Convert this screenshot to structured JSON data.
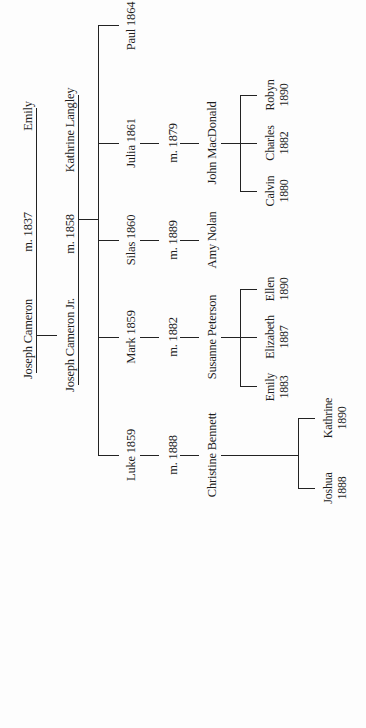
{
  "generation1": {
    "husband": "Joseph Cameron",
    "marriage": "m. 1837",
    "wife": "Emily"
  },
  "generation2": {
    "husband": "Joseph Cameron Jr.",
    "marriage": "m. 1858",
    "wife": "Kathrine Langley"
  },
  "children": [
    {
      "name": "Luke 1859",
      "marriage": "m. 1888",
      "spouse": "Christine Bennett",
      "children": [
        {
          "name": "Joshua",
          "year": "1888"
        },
        {
          "name": "Kathrine",
          "year": "1890"
        }
      ]
    },
    {
      "name": "Mark 1859",
      "marriage": "m. 1882",
      "spouse": "Susanne Peterson",
      "children": [
        {
          "name": "Emily",
          "year": "1883"
        },
        {
          "name": "Elizabeth",
          "year": "1887"
        },
        {
          "name": "Ellen",
          "year": "1890"
        }
      ]
    },
    {
      "name": "Silas 1860",
      "marriage": "m. 1889",
      "spouse": "Amy Nolan",
      "children": []
    },
    {
      "name": "Julia 1861",
      "marriage": "m. 1879",
      "spouse": "John MacDonald",
      "children": [
        {
          "name": "Calvin",
          "year": "1880"
        },
        {
          "name": "Charles",
          "year": "1882"
        },
        {
          "name": "Robyn",
          "year": "1890"
        }
      ]
    },
    {
      "name": "Paul 1864",
      "marriage": "",
      "spouse": "",
      "children": []
    }
  ],
  "colors": {
    "line": "#222222",
    "text": "#1e1e1e",
    "background": "#fdfdfd"
  }
}
